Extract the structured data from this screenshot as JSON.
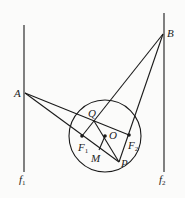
{
  "diagram": {
    "type": "geometry",
    "stroke_color": "#1a1a1a",
    "lines": {
      "f1": {
        "label": "f",
        "sub": "1",
        "x": 24,
        "y1": 25,
        "y2": 172
      },
      "f2": {
        "label": "f",
        "sub": "2",
        "x": 164,
        "y1": 13,
        "y2": 172
      }
    },
    "circle": {
      "center_label": "O",
      "cx": 105,
      "cy": 136,
      "r": 36
    },
    "points": {
      "A": {
        "label": "A",
        "x": 25,
        "y": 93
      },
      "B": {
        "label": "B",
        "x": 163,
        "y": 34
      },
      "Q": {
        "label": "Q",
        "x": 94,
        "y": 121
      },
      "O": {
        "label": "O",
        "x": 105,
        "y": 136
      },
      "F1": {
        "label": "F",
        "sub": "1",
        "x": 82,
        "y": 136
      },
      "F2": {
        "label": "F",
        "sub": "2",
        "x": 129,
        "y": 135
      },
      "M": {
        "label": "M",
        "x": 99,
        "y": 150
      },
      "P": {
        "label": "P",
        "x": 119,
        "y": 162
      }
    },
    "segments": [
      [
        "A",
        "F2"
      ],
      [
        "A",
        "P"
      ],
      [
        "B",
        "F1"
      ],
      [
        "B",
        "P"
      ],
      [
        "Q",
        "P"
      ],
      [
        "O",
        "M"
      ]
    ]
  }
}
